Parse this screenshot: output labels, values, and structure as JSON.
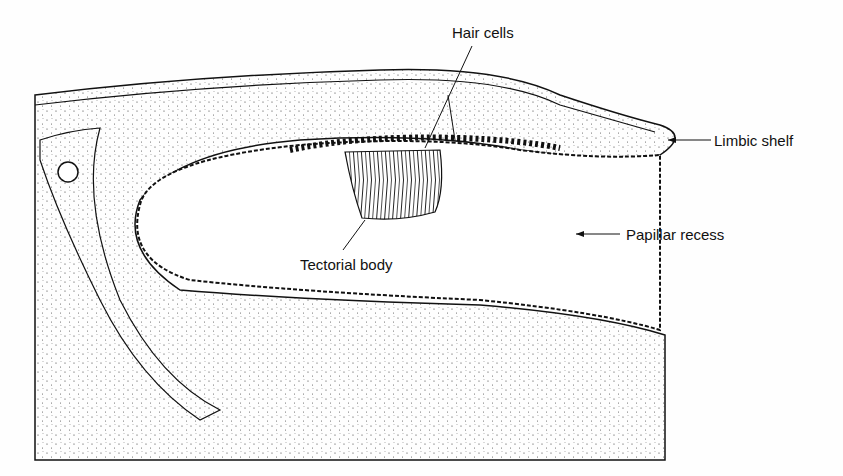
{
  "figure": {
    "type": "anatomical line drawing",
    "labels": {
      "hair_cells": "Hair cells",
      "limbic_shelf": "Limbic shelf",
      "tectorial_body": "Tectorial body",
      "papillar_recess": "Papillar recess"
    }
  }
}
